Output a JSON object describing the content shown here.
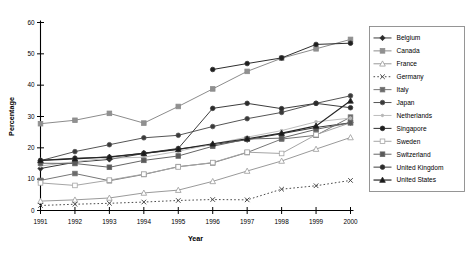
{
  "chart_data": {
    "type": "line",
    "title": "",
    "xlabel": "Year",
    "ylabel": "Percentage",
    "x": [
      1991,
      1992,
      1993,
      1994,
      1995,
      1996,
      1997,
      1998,
      1999,
      2000
    ],
    "xticklabels": [
      "1991",
      "1992",
      "1993",
      "1994",
      "1995",
      "1996",
      "1997",
      "1998",
      "1999",
      "2000"
    ],
    "yticklabels": [
      "0",
      "10",
      "20",
      "30",
      "40",
      "50",
      "60"
    ],
    "yticks": [
      0,
      10,
      20,
      30,
      40,
      50,
      60
    ],
    "ylim": [
      0,
      60
    ],
    "xlim": [
      1991,
      2000
    ],
    "grid": false,
    "legend_position": "right",
    "series": [
      {
        "name": "Belgium",
        "marker": "diamond",
        "fill": "#2b2b2b",
        "color": "#3a3a3a",
        "dash": "none",
        "width": 1.0,
        "values": [
          13.4,
          15.4,
          16.3,
          18.2,
          19.6,
          21.0,
          22.6,
          24.5,
          26.5,
          28.0
        ]
      },
      {
        "name": "Canada",
        "marker": "square",
        "fill": "#909090",
        "color": "#8c8c8c",
        "dash": "none",
        "width": 1.0,
        "values": [
          27.7,
          28.8,
          31.0,
          27.9,
          33.2,
          38.8,
          44.4,
          48.6,
          51.6,
          54.6
        ]
      },
      {
        "name": "France",
        "marker": "triangle-open",
        "fill": "#ffffff",
        "color": "#9a9a9a",
        "dash": "none",
        "width": 1.0,
        "values": [
          3.0,
          3.4,
          4.0,
          5.6,
          6.5,
          9.3,
          12.6,
          15.8,
          19.6,
          23.3
        ]
      },
      {
        "name": "Germany",
        "marker": "x",
        "fill": "#2b2b2b",
        "color": "#4a4a4a",
        "dash": "dotted",
        "width": 1.0,
        "values": [
          1.6,
          2.0,
          2.3,
          2.7,
          3.2,
          3.5,
          3.4,
          6.8,
          7.9,
          9.6
        ]
      },
      {
        "name": "Italy",
        "marker": "square",
        "fill": "#6b6b6b",
        "color": "#777777",
        "dash": "none",
        "width": 1.0,
        "values": [
          9.6,
          11.8,
          9.5,
          11.5,
          14.0,
          15.2,
          18.5,
          22.8,
          24.0,
          29.8
        ]
      },
      {
        "name": "Japan",
        "marker": "circle",
        "fill": "#3a3a3a",
        "color": "#555555",
        "dash": "none",
        "width": 1.0,
        "values": [
          15.9,
          18.8,
          21.0,
          23.2,
          24.0,
          26.8,
          29.3,
          31.3,
          34.2,
          36.6
        ]
      },
      {
        "name": "Netherlands",
        "marker": "plus-small",
        "fill": "#b5b5b5",
        "color": "#bdbdbd",
        "dash": "none",
        "width": 1.0,
        "values": [
          14.2,
          15.6,
          16.7,
          17.0,
          18.9,
          21.2,
          23.4,
          25.5,
          28.3,
          29.5
        ]
      },
      {
        "name": "Singapore",
        "marker": "circle",
        "fill": "#1f1f1f",
        "color": "#2e2e2e",
        "dash": "none",
        "width": 1.0,
        "values": [
          null,
          null,
          null,
          null,
          null,
          45.0,
          46.9,
          48.7,
          53.0,
          53.4
        ]
      },
      {
        "name": "Sweden",
        "marker": "square-open",
        "fill": "#ffffff",
        "color": "#a5a5a5",
        "dash": "none",
        "width": 1.0,
        "values": [
          8.8,
          8.0,
          9.7,
          11.6,
          13.9,
          15.3,
          18.6,
          18.2,
          24.2,
          28.0
        ]
      },
      {
        "name": "Switzerland",
        "marker": "square",
        "fill": "#5a5a5a",
        "color": "#666666",
        "dash": "none",
        "width": 1.0,
        "values": [
          15.1,
          15.0,
          13.8,
          16.0,
          17.4,
          20.5,
          22.8,
          23.1,
          25.9,
          28.0
        ]
      },
      {
        "name": "United Kingdom",
        "marker": "circle",
        "fill": "#2b2b2b",
        "color": "#3d3d3d",
        "dash": "none",
        "width": 1.0,
        "values": [
          16.0,
          16.7,
          17.0,
          18.3,
          19.8,
          32.6,
          34.2,
          32.5,
          34.2,
          32.8
        ]
      },
      {
        "name": "United States",
        "marker": "triangle",
        "fill": "#1a1a1a",
        "color": "#262626",
        "dash": "none",
        "width": 1.2,
        "values": [
          16.0,
          16.5,
          17.1,
          18.2,
          19.5,
          21.3,
          22.9,
          24.7,
          27.0,
          35.0
        ]
      }
    ]
  }
}
